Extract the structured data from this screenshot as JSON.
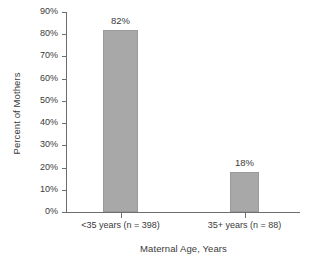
{
  "chart_data": {
    "type": "bar",
    "title": "",
    "subtitle": "",
    "xlabel": "Maternal Age, Years",
    "ylabel": "Percent of Mothers",
    "categories": [
      "<35 years (n = 398)",
      "35+ years (n = 88)"
    ],
    "values": [
      82,
      18
    ],
    "value_labels": [
      "82%",
      "18%"
    ],
    "ylim": [
      0,
      90
    ],
    "ytick_values": [
      0,
      10,
      20,
      30,
      40,
      50,
      60,
      70,
      80,
      90
    ],
    "ytick_labels": [
      "0%",
      "10%",
      "20%",
      "30%",
      "40%",
      "50%",
      "60%",
      "70%",
      "80%",
      "90%"
    ],
    "grid": false,
    "legend": null,
    "legend_position": "none",
    "bar_color": "#a8a8a8",
    "axis_color": "#6e6e6e",
    "text_color": "#3a3a3a",
    "background_color": "#ffffff",
    "annotations": []
  },
  "axis": {
    "y_title": "Percent of Mothers",
    "x_title": "Maternal Age, Years"
  },
  "yticks": [
    {
      "label": "90%",
      "value": 90
    },
    {
      "label": "80%",
      "value": 80
    },
    {
      "label": "70%",
      "value": 70
    },
    {
      "label": "60%",
      "value": 60
    },
    {
      "label": "50%",
      "value": 50
    },
    {
      "label": "40%",
      "value": 40
    },
    {
      "label": "30%",
      "value": 30
    },
    {
      "label": "20%",
      "value": 20
    },
    {
      "label": "10%",
      "value": 10
    },
    {
      "label": "0%",
      "value": 0
    }
  ],
  "bars": [
    {
      "category": "<35 years (n = 398)",
      "value": 82,
      "value_label": "82%"
    },
    {
      "category": "35+ years (n = 88)",
      "value": 18,
      "value_label": "18%"
    }
  ]
}
